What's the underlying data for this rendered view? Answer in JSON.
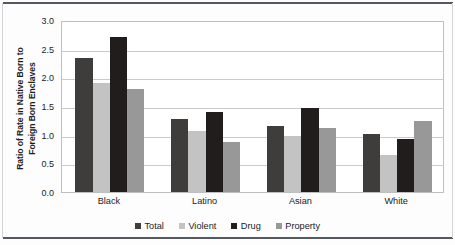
{
  "chart_data": {
    "type": "bar",
    "title": "",
    "subtitle": "",
    "xlabel": "",
    "ylabel": "Ratio of Rate in Native Born to Foreign Born Enclaves",
    "ylabel_lines": [
      "Ratio of Rate in Native Born to",
      "Foreign Born Enclaves"
    ],
    "categories": [
      "Black",
      "Latino",
      "Asian",
      "White"
    ],
    "series": [
      {
        "name": "Total",
        "color": "#3f3d3c",
        "values": [
          2.33,
          1.28,
          1.15,
          1.01
        ]
      },
      {
        "name": "Violent",
        "color": "#c3c3c3",
        "values": [
          1.9,
          1.06,
          0.97,
          0.65
        ]
      },
      {
        "name": "Drug",
        "color": "#211d1c",
        "values": [
          2.71,
          1.4,
          1.46,
          0.92
        ]
      },
      {
        "name": "Property",
        "color": "#989898",
        "values": [
          1.79,
          0.88,
          1.12,
          1.24
        ]
      }
    ],
    "ylim": [
      0.0,
      3.0
    ],
    "ytick_step": 0.5,
    "ytick_labels": [
      "0.0",
      "0.5",
      "1.0",
      "1.5",
      "2.0",
      "2.5",
      "3.0"
    ],
    "grid": "horizontal",
    "legend_position": "bottom",
    "legend_entries": [
      "Total",
      "Violent",
      "Drug",
      "Property"
    ]
  }
}
